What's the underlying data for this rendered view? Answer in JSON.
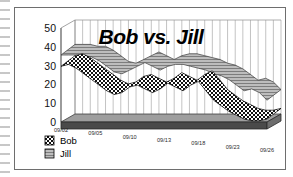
{
  "figure": {
    "title": "Bob vs. Jill",
    "frame_border_color": "#6e6e6e",
    "background": "#ffffff"
  },
  "legend": {
    "position": "bottom-left",
    "entries": [
      {
        "label": "Bob",
        "swatch": "checkered-pattern",
        "color": "#1a1a1a"
      },
      {
        "label": "Jill",
        "swatch": "gray-hatch-pattern",
        "color": "#8a8a8a"
      }
    ]
  },
  "axes": {
    "y_ticks": [
      "0",
      "10",
      "20",
      "30",
      "40",
      "50"
    ],
    "y_min": 0,
    "y_max": 50,
    "x_ticks": [
      "09/02",
      "09/05",
      "09/10",
      "09/13",
      "09/18",
      "09/23",
      "09/26"
    ],
    "grid": "vertical-only",
    "style": "3d-perspective"
  },
  "chart_data": {
    "type": "line",
    "title": "Bob vs. Jill",
    "xlabel": "",
    "ylabel": "",
    "ylim": [
      0,
      50
    ],
    "grid": true,
    "legend_position": "bottom-left",
    "x": [
      "09/02",
      "09/03",
      "09/04",
      "09/05",
      "09/06",
      "09/07",
      "09/08",
      "09/09",
      "09/10",
      "09/11",
      "09/12",
      "09/13",
      "09/14",
      "09/15",
      "09/16",
      "09/17",
      "09/18",
      "09/19",
      "09/20",
      "09/21",
      "09/22",
      "09/23",
      "09/24",
      "09/25",
      "09/26",
      "09/27",
      "09/28",
      "09/29"
    ],
    "series": [
      {
        "name": "Bob",
        "color": "#1a1a1a",
        "marker": "checkered",
        "values": [
          31,
          32,
          30,
          27,
          24,
          21,
          18,
          16,
          17,
          20,
          21,
          19,
          17,
          19,
          22,
          20,
          18,
          21,
          23,
          18,
          13,
          10,
          7,
          5,
          3,
          2,
          2,
          3
        ]
      },
      {
        "name": "Jill",
        "color": "#8a8a8a",
        "marker": "band",
        "values": [
          37,
          37,
          37,
          36,
          36,
          34,
          31,
          28,
          27,
          29,
          31,
          33,
          31,
          29,
          31,
          32,
          32,
          31,
          30,
          29,
          27,
          26,
          24,
          21,
          18,
          19,
          17,
          13
        ]
      }
    ]
  }
}
